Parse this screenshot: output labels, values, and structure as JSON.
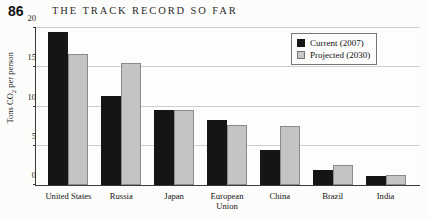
{
  "header": {
    "page_number": "86",
    "title": "THE TRACK RECORD SO FAR"
  },
  "legend": {
    "position": "top-right",
    "entries": [
      {
        "label": "Current (2007)",
        "color": "#151515",
        "icon": "square-swatch-icon"
      },
      {
        "label": "Projected (2030)",
        "color": "#c9c9c9",
        "icon": "square-swatch-icon"
      }
    ]
  },
  "axis": {
    "y_label": "Tons CO",
    "y_label_sub": "2",
    "y_label_tail": " per person",
    "ticks": [
      "0",
      "5",
      "10",
      "15",
      "20"
    ]
  },
  "chart_data": {
    "type": "bar",
    "title": "THE TRACK RECORD SO FAR",
    "xlabel": "",
    "ylabel": "Tons CO2 per person",
    "ylim": [
      0,
      20
    ],
    "yticks": [
      0,
      5,
      10,
      15,
      20
    ],
    "grid": true,
    "legend_position": "top-right",
    "categories": [
      "United States",
      "Russia",
      "Japan",
      "European\nUnion",
      "China",
      "Brazil",
      "India"
    ],
    "series": [
      {
        "name": "Current (2007)",
        "color": "#151515",
        "values": [
          19.5,
          11.4,
          9.6,
          8.3,
          4.5,
          1.9,
          1.2
        ]
      },
      {
        "name": "Projected (2030)",
        "color": "#c9c9c9",
        "values": [
          16.7,
          15.5,
          9.6,
          7.6,
          7.5,
          2.6,
          1.3
        ]
      }
    ]
  }
}
